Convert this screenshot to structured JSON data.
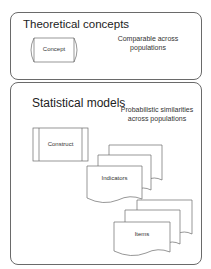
{
  "panels": {
    "theoretical": {
      "title": "Theoretical concepts",
      "shape_label": "Concept",
      "note": "Comparable across populations"
    },
    "statistical": {
      "title": "Statistical models",
      "construct_label": "Construct",
      "indicators_label": "Indicators",
      "items_label": "Items",
      "note": "Probabilistic similarities across populations"
    }
  },
  "colors": {
    "stroke": "#6a6a6a",
    "background": "#ffffff",
    "text": "#222222"
  }
}
